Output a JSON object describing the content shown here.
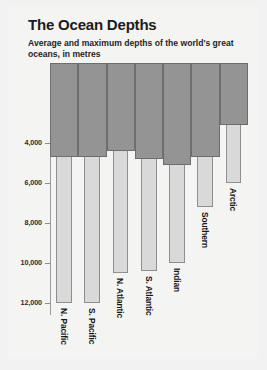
{
  "header": {
    "title": "The Ocean Depths",
    "subtitle": "Average and maximum depths of the world's great oceans, in metres"
  },
  "chart_data": {
    "type": "bar",
    "title": "The Ocean Depths",
    "subtitle": "Average and maximum depths of the world's great oceans, in metres",
    "xlabel": "",
    "ylabel": "",
    "units": "metres",
    "orientation": "vertical-inverted",
    "axis_direction": "downward",
    "ylim": [
      0,
      12600
    ],
    "yticks": [
      4000,
      6000,
      8000,
      10000,
      12000
    ],
    "ytick_labels": [
      "4,000",
      "6,000",
      "8,000",
      "10,000",
      "12,000"
    ],
    "grid": false,
    "legend": "none",
    "categories": [
      "N. Pacific",
      "S. Pacific",
      "N. Atlantic",
      "S. Atlantic",
      "Indian",
      "Southern",
      "Arctic"
    ],
    "series": [
      {
        "name": "Average depth",
        "color": "#949494",
        "values": [
          4700,
          4700,
          4400,
          4800,
          5100,
          4700,
          3100
        ]
      },
      {
        "name": "Maximum depth",
        "color": "#d9d9d9",
        "values": [
          12000,
          12000,
          10500,
          10400,
          10000,
          7200,
          6000
        ]
      }
    ]
  },
  "colors": {
    "background": "#f4f4f3",
    "page": "#f2f2f2",
    "average_bar": "#949494",
    "average_bar_border": "#6e6e6e",
    "maximum_bar": "#d9d9d9",
    "maximum_bar_border": "#8f8f8f",
    "axis": "#9b9b9b",
    "text": "#1b1b1b"
  }
}
